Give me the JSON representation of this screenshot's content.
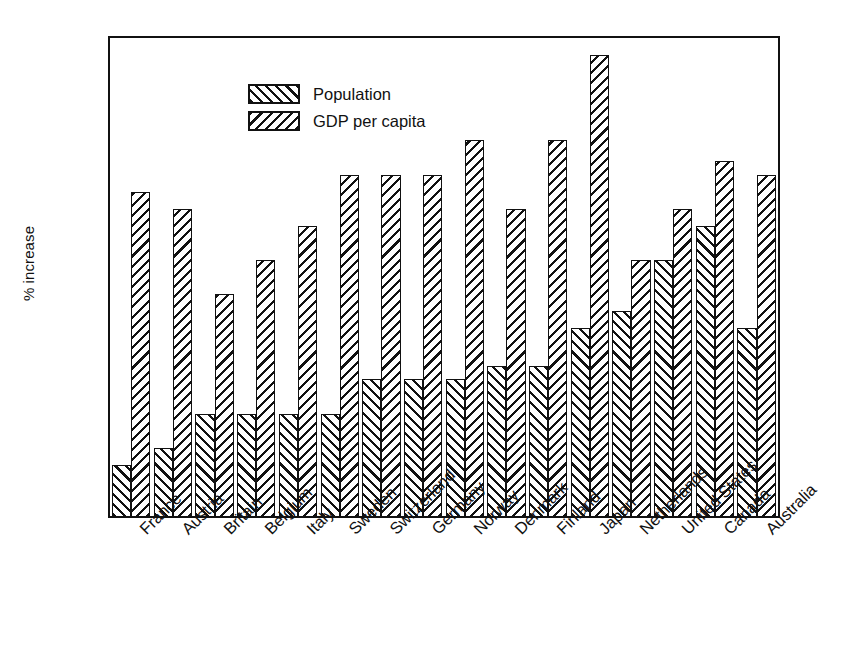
{
  "chart_data": {
    "type": "bar",
    "title": "",
    "xlabel": "",
    "ylabel": "% increase",
    "ylim": [
      0,
      2.8
    ],
    "ytick_labels": [
      "2.8",
      "2.6",
      "2.4",
      "2.2",
      "2.0",
      "1.8",
      "1.6",
      "1.4",
      "1.2",
      "1.0",
      "0.8",
      "0.6",
      "0.4",
      "0.2",
      "0"
    ],
    "ytick_values": [
      2.8,
      2.6,
      2.4,
      2.2,
      2.0,
      1.8,
      1.6,
      1.4,
      1.2,
      1.0,
      0.8,
      0.6,
      0.4,
      0.2,
      0
    ],
    "grid": false,
    "legend_position": "top-left",
    "categories": [
      "France",
      "Austria",
      "Britain",
      "Belgium",
      "Italy",
      "Sweden",
      "Switzerland",
      "Germany",
      "Norway",
      "Denmark",
      "Finland",
      "Japan",
      "Netherlands",
      "United States",
      "Canada",
      "Australia"
    ],
    "series": [
      {
        "name": "Population",
        "hatch": "forward-slash",
        "values": [
          0.3,
          0.4,
          0.6,
          0.6,
          0.6,
          0.6,
          0.8,
          0.8,
          0.8,
          0.88,
          0.88,
          1.1,
          1.2,
          1.5,
          1.7,
          1.1
        ]
      },
      {
        "name": "GDP per capita",
        "hatch": "back-slash",
        "values": [
          1.9,
          1.8,
          1.3,
          1.5,
          1.7,
          2.0,
          2.0,
          2.0,
          2.2,
          1.8,
          2.2,
          2.7,
          1.5,
          1.8,
          2.08,
          2.0
        ]
      }
    ]
  },
  "colors": {
    "ink": "#111111",
    "background": "#ffffff"
  }
}
